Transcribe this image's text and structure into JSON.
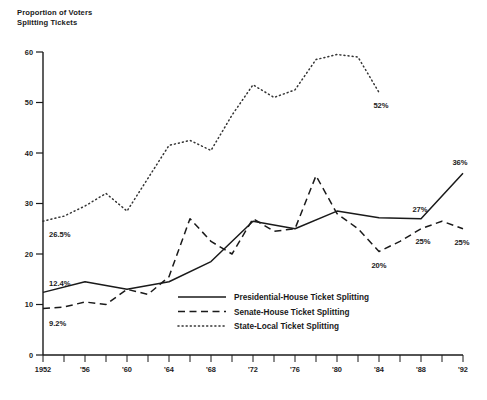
{
  "chart_data": {
    "type": "line",
    "title_line1": "Proportion of Voters",
    "title_line2": "Splitting Tickets",
    "xlabel": "",
    "ylabel": "Proportion of Voters Splitting Tickets",
    "xlim": [
      1952,
      1992
    ],
    "ylim": [
      0,
      60
    ],
    "grid": false,
    "legend_position": "inside-lower-center",
    "y_ticks": [
      0,
      10,
      20,
      30,
      40,
      50,
      60
    ],
    "y_tick_labels": [
      "0",
      "10",
      "20",
      "30",
      "40",
      "50",
      "60"
    ],
    "x_ticks": [
      1952,
      1954,
      1956,
      1958,
      1960,
      1962,
      1964,
      1966,
      1968,
      1970,
      1972,
      1974,
      1976,
      1978,
      1980,
      1982,
      1984,
      1986,
      1988,
      1990,
      1992
    ],
    "x_tick_labels": [
      "1952",
      "",
      "'56",
      "",
      "'60",
      "",
      "'64",
      "",
      "'68",
      "",
      "'72",
      "",
      "'76",
      "",
      "'80",
      "",
      "'84",
      "",
      "'88",
      "",
      "'92"
    ],
    "x": [
      1952,
      1954,
      1956,
      1958,
      1960,
      1962,
      1964,
      1966,
      1968,
      1970,
      1972,
      1974,
      1976,
      1978,
      1980,
      1982,
      1984,
      1986,
      1988,
      1990,
      1992
    ],
    "series": [
      {
        "name": "Presidential-House Ticket Splitting",
        "style": "solid",
        "x": [
          1952,
          1956,
          1960,
          1964,
          1968,
          1972,
          1976,
          1980,
          1984,
          1988,
          1992
        ],
        "values": [
          12.4,
          14.5,
          13.0,
          14.5,
          18.5,
          26.5,
          25.0,
          28.5,
          27.2,
          27.0,
          36.0
        ]
      },
      {
        "name": "Senate-House Ticket Splitting",
        "style": "dashed",
        "x": [
          1952,
          1954,
          1956,
          1958,
          1960,
          1962,
          1964,
          1966,
          1968,
          1970,
          1972,
          1974,
          1976,
          1978,
          1980,
          1982,
          1984,
          1986,
          1988,
          1990,
          1992
        ],
        "values": [
          9.2,
          9.5,
          10.5,
          10.0,
          13.0,
          12.0,
          15.5,
          27.0,
          22.5,
          20.0,
          27.0,
          24.5,
          25.0,
          35.5,
          28.0,
          25.0,
          20.5,
          22.5,
          25.0,
          26.5,
          25.0
        ]
      },
      {
        "name": "State-Local Ticket Splitting",
        "style": "dotted",
        "x": [
          1952,
          1954,
          1956,
          1958,
          1960,
          1962,
          1964,
          1966,
          1968,
          1970,
          1972,
          1974,
          1976,
          1978,
          1980,
          1982,
          1984
        ],
        "values": [
          26.5,
          27.5,
          29.5,
          32.0,
          28.5,
          35.0,
          41.5,
          42.5,
          40.5,
          47.5,
          53.5,
          51.0,
          52.5,
          58.5,
          59.5,
          59.0,
          52.0
        ]
      }
    ],
    "annotations": [
      {
        "label": "26.5%",
        "series": "State-Local Ticket Splitting",
        "x": 1952,
        "value": 26.5
      },
      {
        "label": "12.4%",
        "series": "Presidential-House Ticket Splitting",
        "x": 1952,
        "value": 12.4
      },
      {
        "label": "9.2%",
        "series": "Senate-House Ticket Splitting",
        "x": 1952,
        "value": 9.2
      },
      {
        "label": "52%",
        "series": "State-Local Ticket Splitting",
        "x": 1984,
        "value": 52.0
      },
      {
        "label": "20%",
        "series": "Senate-House Ticket Splitting",
        "x": 1984,
        "value": 20.5
      },
      {
        "label": "27%",
        "series": "Presidential-House Ticket Splitting",
        "x": 1988,
        "value": 27.0
      },
      {
        "label": "25%",
        "series": "Senate-House Ticket Splitting",
        "x": 1988,
        "value": 25.0
      },
      {
        "label": "25%",
        "series": "Senate-House Ticket Splitting",
        "x": 1992,
        "value": 25.0
      },
      {
        "label": "36%",
        "series": "Presidential-House Ticket Splitting",
        "x": 1992,
        "value": 36.0
      }
    ],
    "legend": [
      {
        "label": "Presidential-House Ticket Splitting",
        "style": "solid"
      },
      {
        "label": "Senate-House Ticket Splitting",
        "style": "dashed"
      },
      {
        "label": "State-Local Ticket Splitting",
        "style": "dotted"
      }
    ]
  },
  "colors": {
    "ink": "#1a1a1a",
    "dotted_ink": "#333333",
    "background": "#ffffff"
  }
}
